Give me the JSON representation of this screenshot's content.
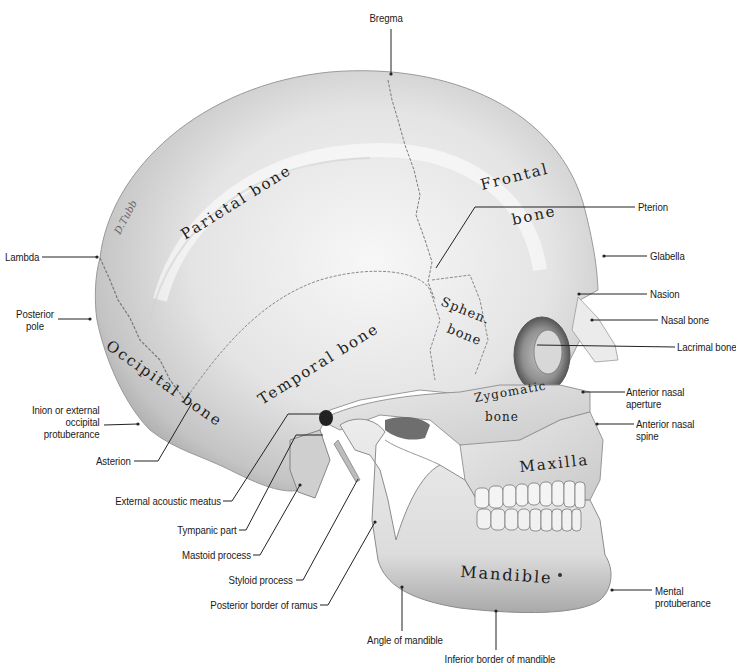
{
  "figure": {
    "colors": {
      "background": "#ffffff",
      "bone_light": "#f2f2f2",
      "bone_mid": "#cfcfcf",
      "bone_dark": "#8a8a8a",
      "label_text": "#1a1a1a",
      "leader_line": "#222222"
    }
  },
  "bones": {
    "parietal": "Parietal bone",
    "frontal_1": "Frontal",
    "frontal_2": "bone",
    "temporal": "Temporal bone",
    "occipital": "Occipital bone",
    "sphenoid_1": "Sphen.",
    "sphenoid_2": "bone",
    "zygomatic_1": "Zygomatic",
    "zygomatic_2": "bone",
    "maxilla": "Maxilla",
    "mandible": "Mandible"
  },
  "labels": {
    "bregma": "Bregma",
    "pterion": "Pterion",
    "lambda": "Lambda",
    "glabella": "Glabella",
    "posterior_pole_1": "Posterior",
    "posterior_pole_2": "pole",
    "nasion": "Nasion",
    "nasal_bone": "Nasal bone",
    "lacrimal_bone": "Lacrimal bone",
    "inion_1": "Inion or external",
    "inion_2": "occipital",
    "inion_3": "protuberance",
    "anterior_nasal_aperture_1": "Anterior nasal",
    "anterior_nasal_aperture_2": "aperture",
    "anterior_nasal_spine_1": "Anterior nasal",
    "anterior_nasal_spine_2": "spine",
    "asterion": "Asterion",
    "external_acoustic_meatus": "External acoustic meatus",
    "tympanic_part": "Tympanic part",
    "mastoid_process": "Mastoid process",
    "styloid_process": "Styloid process",
    "posterior_border_of_ramus": "Posterior border of ramus",
    "angle_of_mandible": "Angle of mandible",
    "mental_protuberance_1": "Mental",
    "mental_protuberance_2": "protuberance",
    "inferior_border_of_mandible": "Inferior border of mandible"
  },
  "signature": "D.Tubb"
}
